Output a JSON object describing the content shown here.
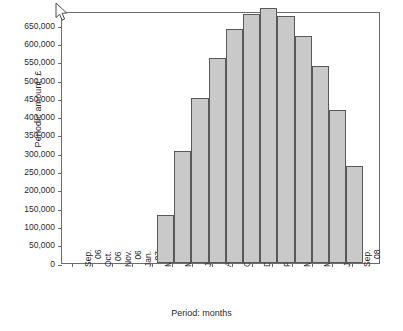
{
  "chart_data": {
    "type": "bar",
    "title": "",
    "xlabel": "Period: months",
    "ylabel": "Periodic amount: £",
    "ylim": [
      0,
      650000
    ],
    "grid": false,
    "legend": null,
    "y_ticks": [
      "0",
      "50,000",
      "100,000",
      "150,000",
      "200,000",
      "250,000",
      "300,000",
      "350,000",
      "400,000",
      "450,000",
      "500,000",
      "550,000",
      "600,000",
      "650,000"
    ],
    "y_tick_values": [
      0,
      50000,
      100000,
      150000,
      200000,
      250000,
      300000,
      350000,
      400000,
      450000,
      500000,
      550000,
      600000,
      650000
    ],
    "x_ticks": [
      "Sep. 06",
      "Nov. 06",
      "Jan. 07",
      "Mar. 07",
      "May 07",
      "Jul. 07",
      "Oct. 07",
      "Dec. 07",
      "Feb. 08",
      "May 08",
      "Jul. 08",
      "Sep. 08"
    ],
    "x_tick_labels": [
      {
        "line1": "Sep.",
        "line2": "06"
      },
      {
        "line1": "Oct.",
        "line2": "06"
      },
      {
        "line1": "Nov.",
        "line2": "06"
      },
      {
        "line1": "Jan.",
        "line2": "07"
      },
      {
        "line1": "Mar.",
        "line2": "07"
      },
      {
        "line1": "May",
        "line2": "07"
      },
      {
        "line1": "Jul.",
        "line2": "07"
      },
      {
        "line1": "Aug.",
        "line2": "07"
      },
      {
        "line1": "Oct.",
        "line2": "07"
      },
      {
        "line1": "Dec.",
        "line2": "07"
      },
      {
        "line1": "Feb.",
        "line2": "08"
      },
      {
        "line1": "Mar.",
        "line2": "08"
      },
      {
        "line1": "May",
        "line2": "08"
      },
      {
        "line1": "Jul.",
        "line2": "08"
      },
      {
        "line1": "Sep.",
        "line2": "08"
      }
    ],
    "categories": [
      "Mar. 07",
      "Apr. 07",
      "May 07",
      "Jun. 07",
      "Jul. 07",
      "Aug. 07",
      "Sep. 07",
      "Oct. 07",
      "Nov. 07",
      "Dec. 07",
      "Jan. 08",
      "Feb. 08",
      "Mar. 08"
    ],
    "values": [
      130000,
      305000,
      450000,
      560000,
      640000,
      682000,
      697000,
      675000,
      622000,
      538000,
      418000,
      264000,
      0
    ],
    "bar_color": "#c9c9c9",
    "bar_border_color": "#595959",
    "axis_color": "#6b6b6b",
    "background_color": "#ffffff"
  },
  "cursor": {
    "icon": "mouse-arrow-cursor"
  }
}
